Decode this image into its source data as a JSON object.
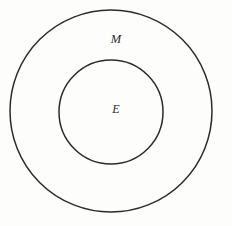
{
  "figure": {
    "type": "euler-diagram",
    "background_color": "#fdfdfc",
    "stroke_color": "#2b2b2b",
    "label_color": "#2b2b2b"
  },
  "outer_circle": {
    "label": "M",
    "center_x": 111,
    "center_y": 111,
    "radius": 101,
    "stroke_width": 1.5,
    "fill": "none"
  },
  "inner_circle": {
    "label": "E",
    "center_x": 111,
    "center_y": 112,
    "radius": 52,
    "stroke_width": 1.5,
    "fill": "none"
  }
}
